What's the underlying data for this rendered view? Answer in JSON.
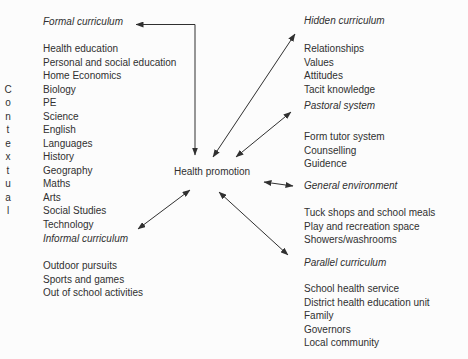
{
  "diagram": {
    "center_label": "Health promotion",
    "contextual_letters": [
      "C",
      "o",
      "n",
      "t",
      "e",
      "x",
      "t",
      "u",
      "a",
      "l"
    ],
    "sections": {
      "formal": {
        "title": "Formal curriculum",
        "items": [
          "Health education",
          "Personal and social education",
          "Home Economics",
          "Biology",
          "PE",
          "Science",
          "English",
          "Languages",
          "History",
          "Geography",
          "Maths",
          "Arts",
          "Social Studies",
          "Technology"
        ]
      },
      "informal": {
        "title": "Informal curriculum",
        "items": [
          "Outdoor pursuits",
          "Sports and games",
          "Out of school activities"
        ]
      },
      "hidden": {
        "title": "Hidden curriculum",
        "items": [
          "Relationships",
          "Values",
          "Attitudes",
          "Tacit knowledge"
        ]
      },
      "pastoral": {
        "title": "Pastoral system",
        "items": [
          "Form tutor system",
          "Counselling",
          "Guidence"
        ]
      },
      "general_environment": {
        "title": "General environment",
        "items": [
          "Tuck shops and school meals",
          "Play and recreation space",
          "Showers/washrooms"
        ]
      },
      "parallel": {
        "title": "Parallel curriculum",
        "items": [
          "School health service",
          "District health education unit",
          "Family",
          "Governors",
          "Local community"
        ]
      }
    },
    "colors": {
      "text": "#303030",
      "background": "#fcfcfc",
      "arrow": "#303030"
    }
  }
}
